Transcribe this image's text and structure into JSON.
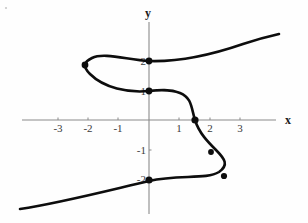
{
  "figure": {
    "name": "cartesian-curve-plot",
    "background": "#fefefe",
    "curve_color": "#0d0d0d",
    "axis_color": "#8a8a8a",
    "label_color": "#3a3a3a"
  },
  "axes": {
    "x_axis_label": "x",
    "y_axis_label": "y",
    "x_label_pos": {
      "x": 288,
      "y": 124
    },
    "y_label_pos": {
      "x": 148,
      "y": 17
    },
    "origin_px": {
      "x": 149,
      "y": 120
    },
    "unit_px": {
      "x": 30.3,
      "y": 29.5
    },
    "x_axis_extent_px": {
      "x1": 22,
      "x2": 276
    },
    "y_axis_extent_px": {
      "y1": 22,
      "y2": 214
    },
    "x_ticks": [
      {
        "value": -3,
        "label": "-3",
        "px": 58
      },
      {
        "value": -2,
        "label": "-2",
        "px": 88
      },
      {
        "value": -1,
        "label": "-1",
        "px": 118
      },
      {
        "value": 1,
        "label": "1",
        "px": 179
      },
      {
        "value": 2,
        "label": "2",
        "px": 210
      },
      {
        "value": 3,
        "label": "3",
        "px": 240
      }
    ],
    "y_ticks": [
      {
        "value": 2,
        "label": "2",
        "px": 61
      },
      {
        "value": 1,
        "label": "1",
        "px": 91
      },
      {
        "value": -1,
        "label": "-1",
        "px": 150
      },
      {
        "value": -2,
        "label": "-2",
        "px": 179
      }
    ]
  },
  "chart_data": {
    "type": "line",
    "title": "",
    "xlabel": "x",
    "ylabel": "y",
    "xlim": [
      -4.2,
      4.2
    ],
    "ylim": [
      -3.3,
      3.3
    ],
    "grid": false,
    "legend": "none",
    "marked_points": [
      {
        "x": 0,
        "y": 2,
        "px": {
          "x": 149,
          "y": 61
        },
        "r": 3.4
      },
      {
        "x": -2.1,
        "y": 1.5,
        "px": {
          "x": 85,
          "y": 65
        },
        "r": 3.4
      },
      {
        "x": 0,
        "y": 1,
        "px": {
          "x": 149,
          "y": 91
        },
        "r": 3.4
      },
      {
        "x": 1.5,
        "y": 0,
        "px": {
          "x": 195,
          "y": 120
        },
        "r": 3.6
      },
      {
        "x": 2.0,
        "y": -1.1,
        "px": {
          "x": 211,
          "y": 152
        },
        "r": 2.9
      },
      {
        "x": 2.5,
        "y": -1.9,
        "px": {
          "x": 224,
          "y": 176
        },
        "r": 3.1
      },
      {
        "x": 0,
        "y": -2,
        "px": {
          "x": 149,
          "y": 180
        },
        "r": 3.6
      }
    ],
    "curve_path_px": "M 20 209 C 60 203 110 190 149 181 C 178 174 206 180 219 172 C 229 165 225 159 216 150 C 208 142 199 133 195 120 C 191 107 192 98 180 93 C 170 89 159 90 149 91 C 128 93 104 88 90 74 C 82 66 84 62 92 58 C 104 52 128 60 149 61 C 180 62 214 54 243 44 C 258 39 270 36 279 34",
    "series": [
      {
        "name": "curve",
        "points": [
          {
            "x": -4.25,
            "y": -3.0
          },
          {
            "x": -2.0,
            "y": -2.35
          },
          {
            "x": 0.0,
            "y": -2.05
          },
          {
            "x": 2.3,
            "y": -1.75
          },
          {
            "x": 2.5,
            "y": -1.9
          },
          {
            "x": 2.2,
            "y": -1.1
          },
          {
            "x": 1.55,
            "y": 0.0
          },
          {
            "x": 1.1,
            "y": 0.85
          },
          {
            "x": 0.0,
            "y": 1.0
          },
          {
            "x": -1.5,
            "y": 1.25
          },
          {
            "x": -2.1,
            "y": 1.55
          },
          {
            "x": -1.85,
            "y": 2.1
          },
          {
            "x": 0.0,
            "y": 2.0
          },
          {
            "x": 2.1,
            "y": 2.4
          },
          {
            "x": 4.3,
            "y": 2.9
          }
        ]
      }
    ]
  },
  "decor": {
    "corner_speck": {
      "x": 6,
      "y": 8
    }
  }
}
